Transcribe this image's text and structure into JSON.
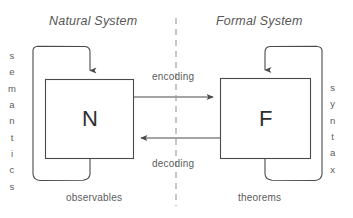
{
  "diagram": {
    "titles": {
      "natural": "Natural System",
      "formal": "Formal System"
    },
    "boxes": [
      {
        "id": "natural-box",
        "letter": "N",
        "caption": "observables",
        "side_label": "semantics"
      },
      {
        "id": "formal-box",
        "letter": "F",
        "caption": "theorems",
        "side_label": "syntax"
      }
    ],
    "arrows": [
      {
        "id": "encoding-arrow",
        "label": "encoding",
        "direction": "left-to-right"
      },
      {
        "id": "decoding-arrow",
        "label": "decoding",
        "direction": "right-to-left"
      }
    ],
    "side_labels": {
      "left": "semantics",
      "left_letters": [
        "s",
        "e",
        "m",
        "a",
        "n",
        "t",
        "i",
        "c",
        "s"
      ],
      "right": "syntax",
      "right_letters": [
        "s",
        "y",
        "n",
        "t",
        "a",
        "x"
      ]
    },
    "captions": {
      "left": "observables",
      "right": "theorems"
    },
    "divider": {
      "style": "dashed-vertical",
      "color": "#9a9a9a"
    },
    "colors": {
      "stroke": "#4a4a4a",
      "text": "#5a5a5a",
      "letter": "#2e2e2e",
      "background": "#ffffff"
    }
  }
}
